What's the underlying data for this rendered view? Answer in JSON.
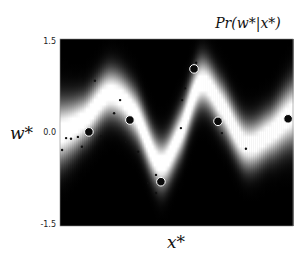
{
  "chart_data": {
    "type": "heatmap",
    "title": "Pr(w*|x*)",
    "xlabel": "x*",
    "ylabel": "w*",
    "xlim": [
      0,
      1
    ],
    "ylim": [
      -1.5,
      1.5
    ],
    "yticks": [
      "1.5",
      "0.0",
      "-1.5"
    ],
    "ytick_values": [
      1.5,
      0.0,
      -1.5
    ],
    "xticks": [],
    "colormap": "gray (black = low density, white = high density)",
    "predictive_mean": {
      "x": [
        0.0,
        0.107,
        0.215,
        0.322,
        0.429,
        0.515,
        0.601,
        0.687,
        0.794,
        0.901,
        1.0
      ],
      "w": [
        0.0,
        0.22,
        0.62,
        0.3,
        -0.5,
        -0.02,
        0.78,
        0.46,
        -0.18,
        -0.02,
        0.3
      ]
    },
    "predictive_std": 0.24,
    "large_points": {
      "name": "training data",
      "x": [
        0.124,
        0.3,
        0.433,
        0.575,
        0.678,
        0.979
      ],
      "w": [
        0.01,
        0.2,
        -0.79,
        1.02,
        0.18,
        0.22
      ]
    },
    "small_points": {
      "name": "samples",
      "x": [
        0.009,
        0.026,
        0.047,
        0.077,
        0.094,
        0.15,
        0.176,
        0.232,
        0.258,
        0.283,
        0.335,
        0.412,
        0.378,
        0.412,
        0.536,
        0.524,
        0.519,
        0.584,
        0.695,
        0.798
      ],
      "w": [
        -0.28,
        -0.09,
        -0.1,
        -0.07,
        -0.23,
        0.83,
        -0.06,
        0.31,
        0.52,
        -0.15,
        -0.31,
        -0.68,
        -0.81,
        -0.97,
        0.71,
        0.52,
        0.07,
        1.12,
        -0.01,
        -0.26
      ]
    },
    "grid": false,
    "legend": "none"
  }
}
